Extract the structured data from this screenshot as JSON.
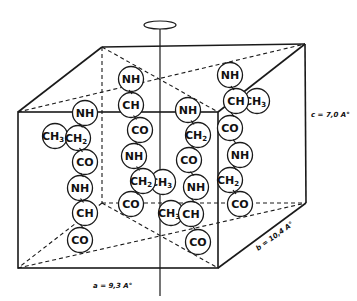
{
  "diagram": {
    "type": "unit-cell-with-peptide-chains",
    "dimensions": {
      "a": "a = 9,3 A°",
      "b": "b = 10,4 A°",
      "c": "c = 7,0 A°"
    },
    "colors": {
      "line": "#1a1a1a",
      "background": "#ffffff"
    },
    "chains": [
      {
        "id": "chain-1",
        "groups": [
          {
            "label": "NH",
            "x": 85,
            "y": 113
          },
          {
            "label": "CH",
            "sub": "2",
            "x": 78,
            "y": 138
          },
          {
            "label": "CH",
            "sub": "3",
            "x": 55,
            "y": 136,
            "side": true
          },
          {
            "label": "CO",
            "x": 85,
            "y": 162
          },
          {
            "label": "NH",
            "x": 80,
            "y": 188
          },
          {
            "label": "CH",
            "x": 85,
            "y": 213
          },
          {
            "label": "CO",
            "x": 80,
            "y": 240
          }
        ]
      },
      {
        "id": "chain-2",
        "groups": [
          {
            "label": "NH",
            "x": 131,
            "y": 79
          },
          {
            "label": "CH",
            "x": 131,
            "y": 105
          },
          {
            "label": "CO",
            "x": 140,
            "y": 130
          },
          {
            "label": "NH",
            "x": 134,
            "y": 156
          },
          {
            "label": "CH",
            "sub": "2",
            "x": 143,
            "y": 181
          },
          {
            "label": "CH",
            "sub": "3",
            "x": 163,
            "y": 182,
            "side": true
          },
          {
            "label": "CO",
            "x": 131,
            "y": 204
          }
        ]
      },
      {
        "id": "chain-3",
        "groups": [
          {
            "label": "NH",
            "x": 188,
            "y": 110
          },
          {
            "label": "CH",
            "sub": "2",
            "x": 198,
            "y": 135
          },
          {
            "label": "CO",
            "x": 189,
            "y": 160
          },
          {
            "label": "NH",
            "x": 196,
            "y": 187
          },
          {
            "label": "CH",
            "x": 191,
            "y": 214
          },
          {
            "label": "CH",
            "sub": "3",
            "x": 171,
            "y": 213,
            "side": true
          },
          {
            "label": "CO",
            "x": 198,
            "y": 242
          }
        ]
      },
      {
        "id": "chain-4",
        "groups": [
          {
            "label": "NH",
            "x": 230,
            "y": 75
          },
          {
            "label": "CH",
            "x": 236,
            "y": 101
          },
          {
            "label": "CH",
            "sub": "3",
            "x": 257,
            "y": 101,
            "side": true
          },
          {
            "label": "CO",
            "x": 230,
            "y": 128
          },
          {
            "label": "NH",
            "x": 240,
            "y": 155
          },
          {
            "label": "CH",
            "sub": "2",
            "x": 230,
            "y": 180
          },
          {
            "label": "CO",
            "x": 240,
            "y": 204
          }
        ]
      }
    ]
  }
}
